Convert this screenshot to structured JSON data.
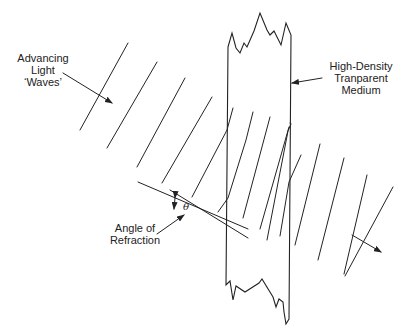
{
  "diagram": {
    "labels": {
      "advancing": [
        "Advancing",
        "Light",
        "‘Waves’"
      ],
      "medium": [
        "High-Density",
        "Tranparent",
        "Medium"
      ],
      "angle": [
        "Angle of",
        "Refraction"
      ],
      "theta": "θ"
    },
    "colors": {
      "line": "#222222",
      "background": "#ffffff"
    },
    "elements": {
      "incident_wavefronts": 4,
      "refracted_wavefronts_inside": 4,
      "emergent_wavefronts": 4,
      "direction_arrows": 2
    }
  }
}
